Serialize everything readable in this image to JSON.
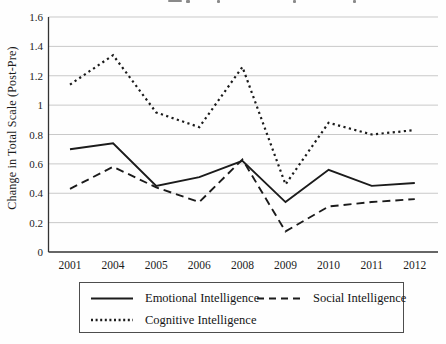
{
  "figure": {
    "note": "chart area",
    "y_axis_title": "Change in Total Scale (Post-Pre)"
  },
  "chart_data": {
    "type": "line",
    "title": "",
    "xlabel": "",
    "ylabel": "Change in Total Scale (Post-Pre)",
    "categories": [
      "2001",
      "2004",
      "2005",
      "2006",
      "2008",
      "2009",
      "2010",
      "2011",
      "2012"
    ],
    "series": [
      {
        "name": "Emotional Intelligence",
        "style": "solid",
        "values": [
          0.7,
          0.74,
          0.45,
          0.51,
          0.62,
          0.34,
          0.56,
          0.45,
          0.47
        ]
      },
      {
        "name": "Social Intelligence",
        "style": "dashed",
        "values": [
          0.43,
          0.58,
          0.44,
          0.34,
          0.63,
          0.14,
          0.31,
          0.34,
          0.36
        ]
      },
      {
        "name": "Cognitive Intelligence",
        "style": "dotted",
        "values": [
          1.14,
          1.34,
          0.95,
          0.85,
          1.26,
          0.46,
          0.88,
          0.8,
          0.83
        ]
      }
    ],
    "ylim": [
      0,
      1.6
    ],
    "y_ticks": [
      0,
      0.2,
      0.4,
      0.6,
      0.8,
      1,
      1.2,
      1.4,
      1.6
    ],
    "grid": true,
    "legend_position": "bottom"
  },
  "legend": {
    "items": [
      {
        "label": "Emotional Intelligence",
        "style": "solid"
      },
      {
        "label": "Social Intelligence",
        "style": "dashed"
      },
      {
        "label": "Cognitive Intelligence",
        "style": "dotted"
      }
    ]
  },
  "colors": {
    "line": "#1b1b1b",
    "grid": "#c9c9c9",
    "axis": "#333333",
    "background": "#fefefe",
    "legend_border": "#4d4d4d"
  }
}
